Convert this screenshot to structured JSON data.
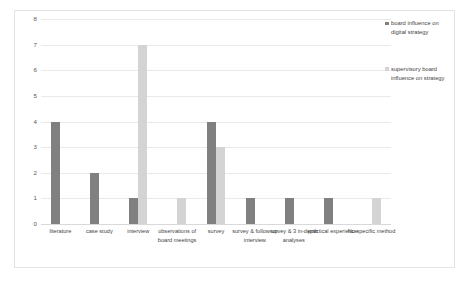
{
  "chart_data": {
    "type": "bar",
    "title": "",
    "subtitle": "",
    "xlabel": "",
    "ylabel": "",
    "ylim": [
      0,
      8
    ],
    "ytick_step": 1,
    "yticks": [
      "8",
      "7",
      "6",
      "5",
      "4",
      "3",
      "2",
      "1",
      "0"
    ],
    "grid": true,
    "legend_position": "right",
    "categories": [
      "literature",
      "case study",
      "interview",
      "observations of board meetings",
      "survey",
      "survey & follow up interview",
      "survey & 3 in-depth analyses",
      "practical experience",
      "No specific method"
    ],
    "series": [
      {
        "name": "board influence on digital strategy",
        "color": "#808080",
        "values": [
          4,
          2,
          1,
          0,
          4,
          1,
          1,
          1,
          0
        ]
      },
      {
        "name": "supervisory board influence on strategy",
        "color": "#d4d4d4",
        "values": [
          0,
          0,
          7,
          1,
          3,
          0,
          0,
          0,
          1
        ]
      }
    ]
  },
  "colors": {
    "series_one": "#808080",
    "series_two": "#d4d4d4",
    "gridline": "#e9e9e9",
    "frame_border": "#e3e3e3",
    "background": "#ffffff"
  }
}
